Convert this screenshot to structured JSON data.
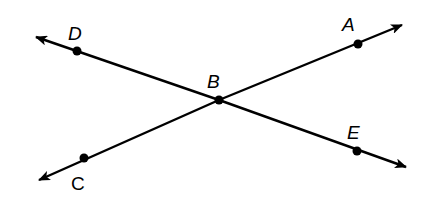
{
  "diagram": {
    "type": "intersecting-lines",
    "stroke_color": "#000000",
    "background": "#ffffff",
    "points": {
      "D": {
        "label": "D",
        "italic": true
      },
      "A": {
        "label": "A",
        "italic": true
      },
      "B": {
        "label": "B",
        "italic": true
      },
      "C": {
        "label": "C",
        "italic": false
      },
      "E": {
        "label": "E",
        "italic": true
      }
    },
    "lines": [
      {
        "name": "line-CA",
        "through": [
          "C",
          "B",
          "A"
        ],
        "arrows": "both"
      },
      {
        "name": "line-DE",
        "through": [
          "D",
          "B",
          "E"
        ],
        "arrows": "both"
      }
    ],
    "intersection": "B"
  }
}
